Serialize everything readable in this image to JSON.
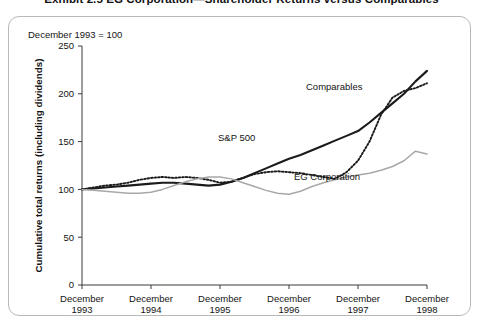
{
  "exhibit": {
    "title": "Exhibit 2.5  EG Corporation—Shareholder Returns versus Comparables"
  },
  "figure": {
    "base_note": "December 1993 = 100"
  },
  "chart_data": {
    "type": "line",
    "title": "EG Corporation—Shareholder Returns versus Comparables",
    "subtitle": "December 1993 = 100",
    "xlabel": "",
    "ylabel": "Cumulative total returns (including dividends)",
    "ylim": [
      0,
      250
    ],
    "yticks": [
      0,
      50,
      100,
      150,
      200,
      250
    ],
    "ytick_labels": [
      "0",
      "50",
      "100",
      "150",
      "200",
      "250"
    ],
    "grid": false,
    "legend_position": "inline-annotation",
    "xlim": [
      0,
      60
    ],
    "xticks": [
      0,
      12,
      24,
      36,
      48,
      60
    ],
    "xtick_labels": [
      "December\n1993",
      "December\n1994",
      "December\n1995",
      "December\n1996",
      "December\n1997",
      "December\n1998"
    ],
    "xtick_labels_split": [
      {
        "month": "December",
        "year": "1993"
      },
      {
        "month": "December",
        "year": "1994"
      },
      {
        "month": "December",
        "year": "1995"
      },
      {
        "month": "December",
        "year": "1996"
      },
      {
        "month": "December",
        "year": "1997"
      },
      {
        "month": "December",
        "year": "1998"
      }
    ],
    "x": [
      0,
      2,
      4,
      6,
      8,
      10,
      12,
      14,
      16,
      18,
      20,
      22,
      24,
      26,
      28,
      30,
      32,
      34,
      36,
      38,
      40,
      42,
      44,
      46,
      48,
      50,
      52,
      54,
      56,
      58,
      60
    ],
    "series": [
      {
        "name": "S&P 500",
        "style": "solid-thick-black",
        "color": "#1b1b1b",
        "values": [
          100,
          101,
          102,
          103,
          104,
          105,
          106,
          107,
          107,
          106,
          105,
          104,
          105,
          108,
          112,
          117,
          122,
          127,
          132,
          136,
          141,
          146,
          151,
          156,
          161,
          170,
          180,
          190,
          200,
          213,
          224
        ]
      },
      {
        "name": "Comparables",
        "style": "dotted-black",
        "color": "#1b1b1b",
        "values": [
          100,
          102,
          104,
          105,
          107,
          110,
          112,
          113,
          112,
          113,
          112,
          110,
          107,
          108,
          112,
          116,
          118,
          119,
          118,
          117,
          115,
          113,
          111,
          118,
          130,
          150,
          178,
          196,
          203,
          206,
          211
        ]
      },
      {
        "name": "EG Corporation",
        "style": "solid-thin-gray",
        "color": "#a8a8a8",
        "values": [
          100,
          99,
          98,
          97,
          96,
          96,
          97,
          100,
          104,
          108,
          111,
          113,
          113,
          111,
          107,
          103,
          99,
          96,
          95,
          98,
          103,
          107,
          110,
          113,
          115,
          117,
          120,
          124,
          130,
          140,
          137
        ]
      }
    ],
    "annotations": [
      {
        "text": "Comparables",
        "x_px": 306,
        "y_px": 90
      },
      {
        "text": "S&P 500",
        "x_px": 218,
        "y_px": 141
      },
      {
        "text": "EG Corporation",
        "x_px": 294,
        "y_px": 180
      }
    ]
  }
}
